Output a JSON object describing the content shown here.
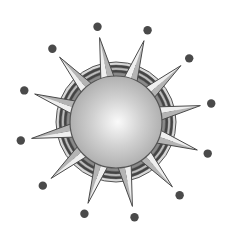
{
  "illustration": {
    "subject": "sun-burst-icon",
    "center": [
      116,
      122
    ],
    "sphere": {
      "radius": 46,
      "fill_light": "#f4f4f4",
      "fill_mid": "#c8c8c8",
      "fill_dark": "#9a9a9a",
      "stroke": "#555555"
    },
    "ring": {
      "outer_radius": 60,
      "stripe_colors": [
        "#d9d9d9",
        "#444444",
        "#bdbdbd",
        "#444444",
        "#8a8a8a"
      ]
    },
    "spikes": {
      "count": 12,
      "start_angle_deg": -101,
      "step_deg": 30,
      "tip_radius": 86,
      "base_radius": 40,
      "half_width_deg": 11,
      "fill_light": "#f2f2f2",
      "fill_dark": "#8e8e8e",
      "stroke": "#4a4a4a"
    },
    "dots": {
      "count": 12,
      "start_angle_deg": -101,
      "step_deg": 30,
      "radius": 97,
      "dot_radius": 4.2,
      "color": "#4a4a4a"
    }
  }
}
